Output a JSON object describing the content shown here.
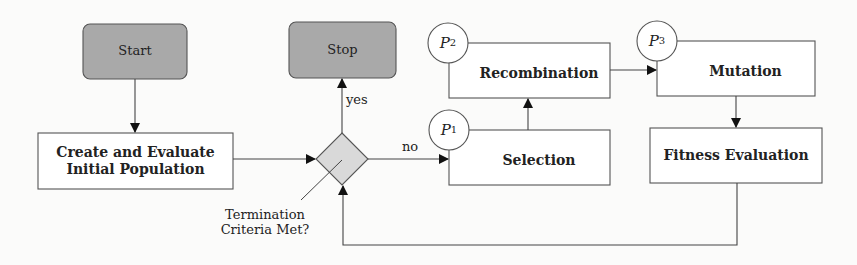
{
  "diagram": {
    "type": "flowchart",
    "nodes": {
      "start": {
        "label": "Start",
        "shape": "rounded-rect",
        "fill": "#a9a9a9"
      },
      "create": {
        "label_line1": "Create and Evaluate",
        "label_line2": "Initial Population",
        "shape": "rect"
      },
      "decision": {
        "shape": "diamond",
        "fill": "#d9d9d9",
        "label_line1": "Termination",
        "label_line2": "Criteria Met?"
      },
      "stop": {
        "label": "Stop",
        "shape": "rounded-rect",
        "fill": "#a9a9a9"
      },
      "selection": {
        "label": "Selection",
        "shape": "rect",
        "marker": {
          "letter": "P",
          "sub": "1"
        }
      },
      "recombination": {
        "label": "Recombination",
        "shape": "rect",
        "marker": {
          "letter": "P",
          "sub": "2"
        }
      },
      "mutation": {
        "label": "Mutation",
        "shape": "rect",
        "marker": {
          "letter": "P",
          "sub": "3"
        }
      },
      "fitness": {
        "label": "Fitness Evaluation",
        "shape": "rect"
      }
    },
    "edges": [
      {
        "from": "start",
        "to": "create",
        "label": ""
      },
      {
        "from": "create",
        "to": "decision",
        "label": ""
      },
      {
        "from": "decision",
        "to": "stop",
        "label": "yes"
      },
      {
        "from": "decision",
        "to": "selection",
        "label": "no"
      },
      {
        "from": "selection",
        "to": "recombination",
        "label": ""
      },
      {
        "from": "recombination",
        "to": "mutation",
        "label": ""
      },
      {
        "from": "mutation",
        "to": "fitness",
        "label": ""
      },
      {
        "from": "fitness",
        "to": "decision",
        "label": ""
      }
    ],
    "edge_labels": {
      "yes": "yes",
      "no": "no"
    }
  }
}
